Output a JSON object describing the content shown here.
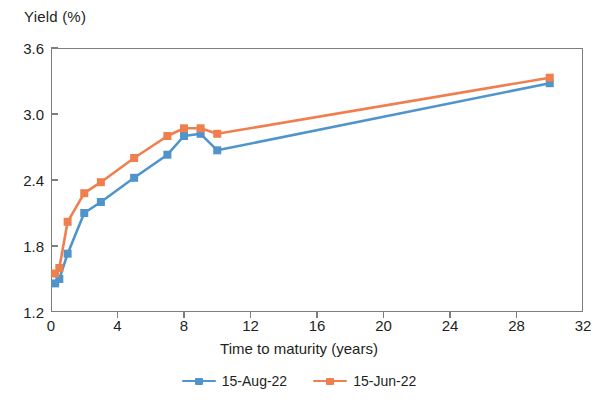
{
  "chart_data": {
    "type": "line",
    "title": "",
    "xlabel": "Time to maturity (years)",
    "ylabel": "Yield (%)",
    "xlim": [
      0,
      32
    ],
    "ylim": [
      1.2,
      3.6
    ],
    "xticks": [
      0,
      4,
      8,
      12,
      16,
      20,
      24,
      28,
      32
    ],
    "yticks": [
      1.2,
      1.8,
      2.4,
      3.0,
      3.6
    ],
    "ytick_labels": [
      "1.2",
      "1.8",
      "2.4",
      "3.0",
      "3.6"
    ],
    "xtick_labels": [
      "0",
      "4",
      "8",
      "12",
      "16",
      "20",
      "24",
      "28",
      "32"
    ],
    "grid": false,
    "legend_position": "bottom-center",
    "markers": "square",
    "series": [
      {
        "name": "15-Aug-22",
        "color": "#4f95cc",
        "x": [
          0.25,
          0.5,
          1,
          2,
          3,
          5,
          7,
          8,
          9,
          10,
          30
        ],
        "values": [
          1.46,
          1.5,
          1.73,
          2.1,
          2.2,
          2.42,
          2.63,
          2.8,
          2.82,
          2.67,
          3.28
        ]
      },
      {
        "name": "15-Jun-22",
        "color": "#f07f4f",
        "x": [
          0.25,
          0.5,
          1,
          2,
          3,
          5,
          7,
          8,
          9,
          10,
          30
        ],
        "values": [
          1.55,
          1.6,
          2.02,
          2.28,
          2.38,
          2.6,
          2.8,
          2.87,
          2.87,
          2.82,
          3.33
        ]
      }
    ]
  },
  "axis": {
    "frame_color": "#7d7d7d"
  }
}
